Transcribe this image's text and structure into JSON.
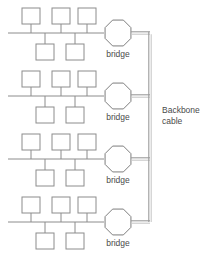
{
  "diagram": {
    "colors": {
      "box_stroke": "#8c8c8c",
      "line": "#8c8c8c",
      "bridge_stroke": "#7d7d7d",
      "backbone_outer": "#9a9a9a",
      "backbone_inner": "#c8c8c8",
      "text": "#4a4a4a",
      "background": "#ffffff"
    },
    "backbone": {
      "label_line1": "Backbone",
      "label_line2": "cable",
      "orientation": "vertical",
      "x": 150,
      "y_top": 33,
      "y_bottom": 222,
      "style": "double-line-thick"
    },
    "segments": [
      {
        "name": "segment-1",
        "bus_y": 33,
        "bus_x_start": 8,
        "bus_x_end": 104,
        "top_nodes": [
          {
            "x": 22,
            "y": 8
          },
          {
            "x": 52,
            "y": 8
          },
          {
            "x": 78,
            "y": 8
          }
        ],
        "bottom_nodes": [
          {
            "x": 36,
            "y": 44
          },
          {
            "x": 66,
            "y": 44
          }
        ],
        "bridge": {
          "cx": 118,
          "cy": 33,
          "r": 14,
          "label": "bridge",
          "label_y": 57
        }
      },
      {
        "name": "segment-2",
        "bus_y": 96,
        "bus_x_start": 8,
        "bus_x_end": 104,
        "top_nodes": [
          {
            "x": 22,
            "y": 71
          },
          {
            "x": 52,
            "y": 71
          },
          {
            "x": 78,
            "y": 71
          }
        ],
        "bottom_nodes": [
          {
            "x": 36,
            "y": 107
          },
          {
            "x": 66,
            "y": 107
          }
        ],
        "bridge": {
          "cx": 118,
          "cy": 96,
          "r": 14,
          "label": "bridge",
          "label_y": 120
        }
      },
      {
        "name": "segment-3",
        "bus_y": 159,
        "bus_x_start": 8,
        "bus_x_end": 104,
        "top_nodes": [
          {
            "x": 22,
            "y": 134
          },
          {
            "x": 52,
            "y": 134
          },
          {
            "x": 78,
            "y": 134
          }
        ],
        "bottom_nodes": [
          {
            "x": 36,
            "y": 170
          },
          {
            "x": 66,
            "y": 170
          }
        ],
        "bridge": {
          "cx": 118,
          "cy": 159,
          "r": 14,
          "label": "bridge",
          "label_y": 183
        }
      },
      {
        "name": "segment-4",
        "bus_y": 222,
        "bus_x_start": 8,
        "bus_x_end": 104,
        "top_nodes": [
          {
            "x": 22,
            "y": 197
          },
          {
            "x": 52,
            "y": 197
          },
          {
            "x": 78,
            "y": 197
          }
        ],
        "bottom_nodes": [
          {
            "x": 36,
            "y": 233
          },
          {
            "x": 66,
            "y": 233
          }
        ],
        "bridge": {
          "cx": 118,
          "cy": 222,
          "r": 14,
          "label": "bridge",
          "label_y": 246
        }
      }
    ],
    "node_size": {
      "width": 18,
      "height": 16
    }
  }
}
